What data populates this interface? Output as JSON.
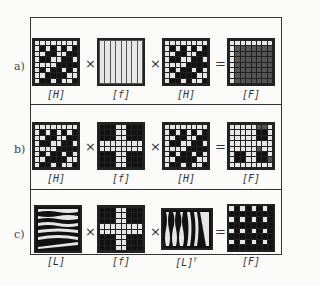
{
  "figure": {
    "rows": [
      {
        "label": "a)",
        "operators": [
          "×",
          "×",
          "="
        ],
        "matrices": [
          {
            "name": "hadamard-matrix",
            "label": "[H]",
            "kind": "H"
          },
          {
            "name": "filter-matrix",
            "label": "[f]",
            "kind": "f_vertical"
          },
          {
            "name": "hadamard-matrix",
            "label": "[H]",
            "kind": "H"
          },
          {
            "name": "result-matrix",
            "label": "[F]",
            "kind": "F_a"
          }
        ]
      },
      {
        "label": "b)",
        "operators": [
          "×",
          "×",
          "="
        ],
        "matrices": [
          {
            "name": "hadamard-matrix",
            "label": "[H]",
            "kind": "H"
          },
          {
            "name": "filter-matrix",
            "label": "[f]",
            "kind": "f_cross"
          },
          {
            "name": "hadamard-matrix",
            "label": "[H]",
            "kind": "H"
          },
          {
            "name": "result-matrix",
            "label": "[F]",
            "kind": "F_b"
          }
        ]
      },
      {
        "label": "c)",
        "operators": [
          "×",
          "×",
          "="
        ],
        "matrices": [
          {
            "name": "legendre-matrix",
            "label": "[L]",
            "kind": "L"
          },
          {
            "name": "filter-matrix",
            "label": "[f]",
            "kind": "f_cross"
          },
          {
            "name": "legendre-transpose-matrix",
            "label": "[L]",
            "sup": "T",
            "kind": "LT"
          },
          {
            "name": "result-matrix",
            "label": "[F]",
            "kind": "F_c"
          }
        ]
      }
    ],
    "patterns": {
      "H": [
        [
          1,
          1,
          1,
          1,
          1,
          1,
          1,
          1
        ],
        [
          1,
          0,
          1,
          0,
          1,
          0,
          1,
          0
        ],
        [
          1,
          1,
          0,
          0,
          1,
          1,
          0,
          0
        ],
        [
          1,
          0,
          0,
          1,
          1,
          0,
          0,
          1
        ],
        [
          1,
          1,
          1,
          1,
          0,
          0,
          0,
          0
        ],
        [
          1,
          0,
          1,
          0,
          0,
          1,
          0,
          1
        ],
        [
          1,
          1,
          0,
          0,
          0,
          0,
          1,
          1
        ],
        [
          1,
          0,
          0,
          1,
          0,
          1,
          1,
          0
        ]
      ],
      "f_vertical": [
        [
          1,
          1,
          1,
          1,
          1,
          1,
          1,
          1
        ],
        [
          1,
          1,
          1,
          1,
          1,
          1,
          1,
          1
        ],
        [
          1,
          1,
          1,
          1,
          1,
          1,
          1,
          1
        ],
        [
          1,
          1,
          1,
          1,
          1,
          1,
          1,
          1
        ],
        [
          1,
          1,
          1,
          1,
          1,
          1,
          1,
          1
        ],
        [
          1,
          1,
          1,
          1,
          1,
          1,
          1,
          1
        ],
        [
          1,
          1,
          1,
          1,
          1,
          1,
          1,
          1
        ],
        [
          1,
          1,
          1,
          1,
          1,
          1,
          1,
          1
        ]
      ],
      "f_cross": [
        [
          0,
          0,
          0,
          1,
          1,
          0,
          0,
          0
        ],
        [
          0,
          0,
          0,
          1,
          1,
          0,
          0,
          0
        ],
        [
          0,
          0,
          0,
          1,
          1,
          0,
          0,
          0
        ],
        [
          1,
          1,
          1,
          1,
          1,
          1,
          1,
          1
        ],
        [
          1,
          1,
          1,
          1,
          1,
          1,
          1,
          1
        ],
        [
          0,
          0,
          0,
          1,
          1,
          0,
          0,
          0
        ],
        [
          0,
          0,
          0,
          1,
          1,
          0,
          0,
          0
        ],
        [
          0,
          0,
          0,
          1,
          1,
          0,
          0,
          0
        ]
      ],
      "F_a": [
        [
          1,
          1,
          1,
          1,
          1,
          1,
          1,
          1
        ],
        [
          1,
          2,
          2,
          2,
          2,
          2,
          2,
          2
        ],
        [
          1,
          2,
          2,
          2,
          2,
          2,
          2,
          2
        ],
        [
          1,
          2,
          2,
          2,
          2,
          2,
          2,
          2
        ],
        [
          1,
          2,
          2,
          2,
          2,
          2,
          2,
          2
        ],
        [
          1,
          2,
          2,
          2,
          2,
          2,
          2,
          2
        ],
        [
          1,
          2,
          2,
          2,
          2,
          2,
          2,
          2
        ],
        [
          1,
          2,
          2,
          2,
          2,
          2,
          2,
          2
        ]
      ],
      "F_b": [
        [
          1,
          1,
          1,
          1,
          1,
          2,
          2,
          1
        ],
        [
          1,
          1,
          1,
          1,
          1,
          0,
          0,
          1
        ],
        [
          1,
          1,
          1,
          1,
          1,
          0,
          0,
          1
        ],
        [
          1,
          1,
          1,
          1,
          1,
          1,
          1,
          1
        ],
        [
          1,
          1,
          1,
          1,
          1,
          2,
          1,
          1
        ],
        [
          1,
          0,
          0,
          1,
          1,
          0,
          0,
          1
        ],
        [
          1,
          0,
          0,
          1,
          1,
          0,
          0,
          2
        ],
        [
          1,
          1,
          1,
          1,
          1,
          1,
          1,
          1
        ]
      ],
      "F_c": [
        [
          1,
          0,
          1,
          0,
          1,
          0,
          1,
          0
        ],
        [
          0,
          0,
          0,
          0,
          0,
          0,
          0,
          0
        ],
        [
          1,
          0,
          1,
          0,
          1,
          0,
          1,
          0
        ],
        [
          0,
          0,
          0,
          0,
          0,
          0,
          0,
          0
        ],
        [
          1,
          0,
          1,
          0,
          1,
          0,
          1,
          0
        ],
        [
          0,
          0,
          0,
          0,
          0,
          0,
          0,
          0
        ],
        [
          1,
          0,
          1,
          0,
          1,
          0,
          1,
          0
        ],
        [
          0,
          0,
          0,
          0,
          0,
          0,
          0,
          0
        ]
      ]
    }
  }
}
